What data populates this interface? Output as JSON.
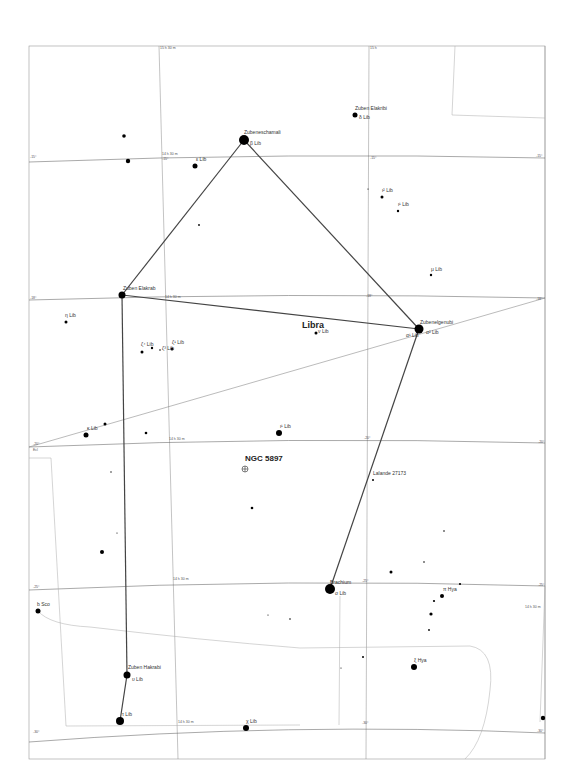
{
  "map": {
    "constellation": "Libra",
    "deep_sky_object": "NGC 5897",
    "frame": {
      "x": 29,
      "y": 46,
      "w": 516,
      "h": 713
    },
    "grid_labels": {
      "ra_top_left": "15 h 30 m",
      "ra_top_right": "15 h",
      "ra_mid_1": "14 h 30 m",
      "ra_right": "14 h 30 m",
      "dec_m15": "-15°",
      "dec_m18": "-18°",
      "dec_m20": "-20°",
      "dec_m21": "-21°",
      "dec_m25": "-25°",
      "dec_m30": "-30°",
      "ecliptic": "Ecl"
    },
    "stars": [
      {
        "id": "zubeneschamali",
        "name": "Zubeneschamali",
        "desig": "β Lib",
        "x": 244,
        "y": 140,
        "r": 5
      },
      {
        "id": "zuben-elakribi",
        "name": "Zuben Elakribi",
        "desig": "δ Lib",
        "x": 355,
        "y": 115,
        "r": 2.5
      },
      {
        "id": "zubenelgenubi",
        "name": "Zubenelgenubi",
        "desig": "α² Lib",
        "desig2": "α¹ Lib",
        "x": 419,
        "y": 329,
        "r": 4.5
      },
      {
        "id": "zuben-elakrab",
        "name": "Zuben Elakrab",
        "desig": "γ Lib",
        "x": 122,
        "y": 295,
        "r": 3.5
      },
      {
        "id": "brachium",
        "name": "Brachium",
        "desig": "σ Lib",
        "x": 330,
        "y": 589,
        "r": 5
      },
      {
        "id": "zuben-hakrabi",
        "name": "Zuben Hakrabi",
        "desig": "υ Lib",
        "x": 127,
        "y": 675,
        "r": 3.5
      },
      {
        "id": "tau-lib",
        "name": "",
        "desig": "τ Lib",
        "x": 120,
        "y": 721,
        "r": 4
      },
      {
        "id": "iota-lib",
        "name": "",
        "desig": "ι¹ Lib",
        "x": 279,
        "y": 433,
        "r": 3
      },
      {
        "id": "nu-lib",
        "name": "",
        "desig": "ν Lib",
        "x": 316,
        "y": 333,
        "r": 1.5
      },
      {
        "id": "kappa-lib",
        "name": "",
        "desig": "κ Lib",
        "x": 86,
        "y": 435,
        "r": 2.5
      },
      {
        "id": "eta-lib",
        "name": "",
        "desig": "η Lib",
        "x": 66,
        "y": 322,
        "r": 1.5
      },
      {
        "id": "zeta4-lib",
        "name": "",
        "desig": "ζ⁴ Lib",
        "x": 142,
        "y": 352,
        "r": 1.5
      },
      {
        "id": "zeta3-lib",
        "name": "",
        "desig": "ζ³ Lib",
        "x": 152,
        "y": 348,
        "r": 1.2
      },
      {
        "id": "zeta1-lib",
        "name": "",
        "desig": "ζ¹ Lib",
        "x": 172,
        "y": 349,
        "r": 1.5
      },
      {
        "id": "epsilon-lib",
        "name": "",
        "desig": "ε Lib",
        "x": 195,
        "y": 166,
        "r": 2.5
      },
      {
        "id": "iota2-lib",
        "name": "",
        "desig": "ι² Lib",
        "x": 382,
        "y": 197,
        "r": 1.5
      },
      {
        "id": "iota1-lib",
        "name": "",
        "desig": "ι¹ Lib",
        "x": 398,
        "y": 211,
        "r": 1.2
      },
      {
        "id": "mu-lib",
        "name": "",
        "desig": "μ Lib",
        "x": 431,
        "y": 275,
        "r": 1.2
      },
      {
        "id": "lalande",
        "name": "Lalande 27173",
        "desig": "",
        "x": 373,
        "y": 480,
        "r": 1
      },
      {
        "id": "pi-hya",
        "name": "",
        "desig": "π Hya",
        "x": 442,
        "y": 596,
        "r": 2
      },
      {
        "id": "xi-hya",
        "name": "",
        "desig": "ξ Hya",
        "x": 414,
        "y": 667,
        "r": 3
      },
      {
        "id": "b-boo",
        "name": "",
        "desig": "b Sco",
        "x": 38,
        "y": 611,
        "r": 2.5
      },
      {
        "id": "chi-lib",
        "name": "",
        "desig": "χ Lib",
        "x": 246,
        "y": 728,
        "r": 3
      }
    ],
    "unlabeled_stars": [
      {
        "x": 124,
        "y": 136,
        "r": 1.8
      },
      {
        "x": 128,
        "y": 161,
        "r": 2.2
      },
      {
        "x": 199,
        "y": 225,
        "r": 0.9
      },
      {
        "x": 368,
        "y": 189,
        "r": 0.6
      },
      {
        "x": 105,
        "y": 424,
        "r": 1.5
      },
      {
        "x": 146,
        "y": 433,
        "r": 1.3
      },
      {
        "x": 111,
        "y": 472,
        "r": 0.7
      },
      {
        "x": 252,
        "y": 508,
        "r": 1.3
      },
      {
        "x": 117,
        "y": 533,
        "r": 0.6
      },
      {
        "x": 102,
        "y": 552,
        "r": 2
      },
      {
        "x": 444,
        "y": 531,
        "r": 0.8
      },
      {
        "x": 424,
        "y": 562,
        "r": 0.8
      },
      {
        "x": 391,
        "y": 572,
        "r": 1.5
      },
      {
        "x": 460,
        "y": 584,
        "r": 1.1
      },
      {
        "x": 434,
        "y": 601,
        "r": 1.1
      },
      {
        "x": 431,
        "y": 614,
        "r": 1.6
      },
      {
        "x": 429,
        "y": 630,
        "r": 0.9
      },
      {
        "x": 268,
        "y": 615,
        "r": 0.6
      },
      {
        "x": 290,
        "y": 619,
        "r": 0.8
      },
      {
        "x": 363,
        "y": 657,
        "r": 1
      },
      {
        "x": 341,
        "y": 668,
        "r": 0.6
      },
      {
        "x": 543,
        "y": 718,
        "r": 2.2
      },
      {
        "x": 160,
        "y": 350,
        "r": 0.8
      }
    ],
    "constellation_lines": [
      [
        122,
        295,
        244,
        140
      ],
      [
        244,
        140,
        419,
        329
      ],
      [
        122,
        295,
        419,
        329
      ],
      [
        419,
        329,
        330,
        589
      ],
      [
        122,
        295,
        127,
        675
      ],
      [
        127,
        675,
        120,
        721
      ]
    ]
  }
}
